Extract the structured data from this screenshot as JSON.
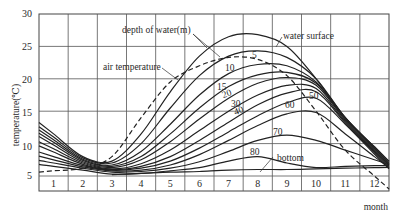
{
  "chart_data": {
    "type": "line",
    "title": "",
    "xlabel": "month",
    "ylabel": "temperature(℃)",
    "ylim": [
      5,
      30
    ],
    "yticks": [
      5,
      10,
      15,
      20,
      25,
      30
    ],
    "grid": true,
    "legend": "inline labels",
    "categories": [
      "1",
      "2",
      "3",
      "4",
      "5",
      "6",
      "7",
      "8",
      "9",
      "10",
      "11",
      "12"
    ],
    "x": [
      1,
      2,
      3,
      4,
      5,
      6,
      7,
      8,
      9,
      10,
      11,
      12
    ],
    "annotations": [
      "depth of water(m)",
      "water surface",
      "air temperature",
      "bottom"
    ],
    "series": [
      {
        "name": "water surface",
        "label": "",
        "style": "solid",
        "values": [
          11.5,
          8.0,
          7.3,
          11.5,
          18.0,
          23.5,
          26.5,
          26.8,
          25.0,
          20.0,
          14.0,
          9.5
        ]
      },
      {
        "name": "5 m",
        "label": "5",
        "style": "solid",
        "values": [
          11.0,
          7.8,
          7.0,
          10.0,
          15.5,
          20.5,
          23.5,
          24.3,
          23.3,
          20.0,
          14.0,
          9.5
        ]
      },
      {
        "name": "air temperature",
        "label": "",
        "style": "dashed",
        "values": [
          5.8,
          6.2,
          8.0,
          14.0,
          19.5,
          22.0,
          23.3,
          23.0,
          20.5,
          15.0,
          9.0,
          5.0
        ]
      },
      {
        "name": "10 m",
        "label": "10",
        "style": "solid",
        "values": [
          10.6,
          7.6,
          6.7,
          8.8,
          13.0,
          17.5,
          20.8,
          22.2,
          22.0,
          19.5,
          14.0,
          9.3
        ]
      },
      {
        "name": "15 m",
        "label": "15",
        "style": "solid",
        "values": [
          10.2,
          7.4,
          6.5,
          8.0,
          11.5,
          15.5,
          18.8,
          20.6,
          21.0,
          19.3,
          13.8,
          9.2
        ]
      },
      {
        "name": "20 m",
        "label": "20",
        "style": "solid",
        "values": [
          9.8,
          7.2,
          6.3,
          7.5,
          10.3,
          13.8,
          17.0,
          19.3,
          20.2,
          19.0,
          13.6,
          9.0
        ]
      },
      {
        "name": "30 m",
        "label": "30",
        "style": "solid",
        "values": [
          9.2,
          7.0,
          6.1,
          6.9,
          9.0,
          12.0,
          15.0,
          17.5,
          19.0,
          18.5,
          13.4,
          8.8
        ]
      },
      {
        "name": "40 m",
        "label": "40",
        "style": "solid",
        "values": [
          8.7,
          6.8,
          6.0,
          6.5,
          8.0,
          10.5,
          13.3,
          16.0,
          17.8,
          18.0,
          13.2,
          8.6
        ]
      },
      {
        "name": "50 m",
        "label": "50",
        "style": "solid",
        "values": [
          8.0,
          6.6,
          5.9,
          6.2,
          7.3,
          9.3,
          11.8,
          14.3,
          16.3,
          17.0,
          13.0,
          8.4
        ]
      },
      {
        "name": "60 m",
        "label": "60",
        "style": "solid",
        "values": [
          7.5,
          6.4,
          5.8,
          5.9,
          6.7,
          8.3,
          10.5,
          12.8,
          14.6,
          14.8,
          11.5,
          8.0
        ]
      },
      {
        "name": "70 m",
        "label": "70",
        "style": "solid",
        "values": [
          7.0,
          6.2,
          5.6,
          5.7,
          6.2,
          7.2,
          8.8,
          10.5,
          11.3,
          10.5,
          9.0,
          7.5
        ]
      },
      {
        "name": "80 m",
        "label": "80",
        "style": "solid",
        "values": [
          6.5,
          5.9,
          5.3,
          5.4,
          5.8,
          6.3,
          7.3,
          8.0,
          7.0,
          6.3,
          6.5,
          6.6
        ]
      },
      {
        "name": "bottom",
        "label": "",
        "style": "solid",
        "values": [
          null,
          null,
          5.2,
          5.4,
          5.6,
          5.7,
          5.9,
          6.0,
          6.0,
          6.1,
          6.2,
          6.3
        ]
      }
    ]
  },
  "labels": {
    "ylabel": "temperature(℃)",
    "xlabel": "month",
    "depth_title": "depth of water(m)",
    "water_surface": "water surface",
    "air_temperature": "air temperature",
    "bottom": "bottom",
    "d5": "5",
    "d10": "10",
    "d15": "15",
    "d20": "20",
    "d30": "30",
    "d40": "40",
    "d50": "50",
    "d60": "60",
    "d70": "70",
    "d80": "80"
  },
  "axis": {
    "y": [
      "30",
      "25",
      "20",
      "15",
      "10",
      "5"
    ],
    "months": [
      "1",
      "2",
      "3",
      "4",
      "5",
      "6",
      "7",
      "8",
      "9",
      "10",
      "11",
      "12"
    ]
  }
}
